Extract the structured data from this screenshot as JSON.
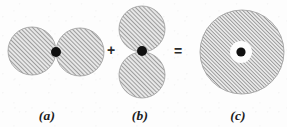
{
  "figure": {
    "width": 287,
    "height": 127,
    "background_color": "#fdfdfd",
    "hatch_color": "#6e6e6e",
    "hatch_fill_tone": "#c9c9c9",
    "dot_color": "#101010",
    "edge_color": "#8a8a8a"
  },
  "panels": [
    {
      "id": "a",
      "caption": "(a)",
      "caption_x": 47,
      "caption_y": 108,
      "shape": "horizontal-dumbbell",
      "lobes": [
        {
          "name": "left-lobe",
          "cx": 32,
          "cy": 51,
          "r": 24
        },
        {
          "name": "right-lobe",
          "cx": 80,
          "cy": 52,
          "r": 24
        }
      ],
      "nucleus": {
        "cx": 56,
        "cy": 52,
        "r": 5
      }
    },
    {
      "id": "b",
      "caption": "(b)",
      "caption_x": 140,
      "caption_y": 108,
      "shape": "vertical-dumbbell",
      "lobes": [
        {
          "name": "top-lobe",
          "cx": 142,
          "cy": 29,
          "r": 23
        },
        {
          "name": "bottom-lobe",
          "cx": 142,
          "cy": 75,
          "r": 23
        }
      ],
      "nucleus": {
        "cx": 142,
        "cy": 51,
        "r": 5
      }
    },
    {
      "id": "c",
      "caption": "(c)",
      "caption_x": 238,
      "caption_y": 108,
      "shape": "annular-disc",
      "disc": {
        "name": "outer-disc",
        "cx": 242,
        "cy": 52,
        "r": 42
      },
      "gap": {
        "name": "inner-white-gap",
        "cx": 241,
        "cy": 52,
        "r": 11
      },
      "nucleus": {
        "cx": 241,
        "cy": 52,
        "r": 4.6
      }
    }
  ],
  "operators": [
    {
      "name": "plus-operator",
      "symbol": "+",
      "x": 111,
      "y": 50
    },
    {
      "name": "equals-operator",
      "symbol": "=",
      "x": 178,
      "y": 51
    }
  ]
}
